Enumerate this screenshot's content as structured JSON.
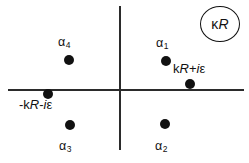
{
  "figure": {
    "type": "complex-plane-pole-diagram",
    "width": 249,
    "height": 163,
    "background_color": "#ffffff",
    "line_color": "#2b2b2b",
    "point_color": "#111111"
  },
  "axes": {
    "horizontal_label": "",
    "vertical_label": "",
    "origin_x": 120,
    "origin_y": 89
  },
  "annotation": {
    "circled": {
      "kappa": "κ",
      "r": "R"
    }
  },
  "poles": [
    {
      "id": "alpha4",
      "label_alpha": "α",
      "label_sub": "4",
      "x": 69,
      "y": 60,
      "quadrant": "upper-left"
    },
    {
      "id": "alpha1",
      "label_alpha": "α",
      "label_sub": "1",
      "x": 166,
      "y": 61,
      "quadrant": "upper-right"
    },
    {
      "id": "alpha3",
      "label_alpha": "α",
      "label_sub": "3",
      "x": 70,
      "y": 125,
      "quadrant": "lower-left"
    },
    {
      "id": "alpha2",
      "label_alpha": "α",
      "label_sub": "2",
      "x": 165,
      "y": 124,
      "quadrant": "lower-right"
    },
    {
      "id": "kr-plus-i-epsilon",
      "label_parts": {
        "k": "k",
        "r": "R",
        "op": "+",
        "i": "i",
        "epsilon": "ε"
      },
      "label_text": "kR+iε",
      "x": 190,
      "y": 84,
      "quadrant": "on-axis-right"
    },
    {
      "id": "minus-kr-minus-i-epsilon",
      "label_parts": {
        "minus": "-",
        "k": "k",
        "r": "R",
        "op": "-",
        "i": "i",
        "epsilon": "ε"
      },
      "label_text": "-kR-iε",
      "x": 48,
      "y": 94,
      "quadrant": "on-axis-left"
    }
  ]
}
